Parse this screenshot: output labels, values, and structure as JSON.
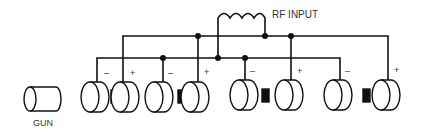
{
  "labels": {
    "rf_input": "RF INPUT",
    "gun": "GUN",
    "minus": "–",
    "plus": "+"
  },
  "components": {
    "gun": {
      "label": "GUN"
    },
    "rf_coil": {
      "label": "RF INPUT",
      "turns": 3
    },
    "electrode_pairs": [
      {
        "index": 1,
        "negative": "–",
        "positive": "+"
      },
      {
        "index": 2,
        "negative": "–",
        "positive": "+"
      },
      {
        "index": 3,
        "negative": "–",
        "positive": "+"
      },
      {
        "index": 4,
        "negative": "–",
        "positive": "+"
      }
    ]
  },
  "colors": {
    "line": "#111111",
    "text": "#333333",
    "background": "#ffffff"
  }
}
